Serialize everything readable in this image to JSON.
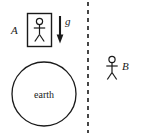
{
  "figure": {
    "type": "physics-diagram",
    "background_color": "#ffffff",
    "ink_color": "#1a1a1a"
  },
  "left_scene": {
    "observer_label": "A",
    "acceleration_label": "g",
    "planet_label": "earth",
    "box": {
      "x": 27,
      "y": 13,
      "width": 25,
      "height": 34
    },
    "planet_circle": {
      "cx": 44,
      "cy": 94,
      "r": 32
    },
    "arrow": {
      "x": 60,
      "y_start": 16,
      "y_end": 43,
      "direction": "down"
    }
  },
  "divider": {
    "name": "dashed-vertical-line",
    "x": 88,
    "y_start": 2,
    "y_end": 133,
    "dash": "4 4"
  },
  "right_scene": {
    "observer_label": "B",
    "figure_position": {
      "x": 112,
      "y": 56
    }
  },
  "stick_figures": [
    {
      "id": "figure-a",
      "label": "A",
      "inside_box": true
    },
    {
      "id": "figure-b",
      "label": "B",
      "inside_box": false
    }
  ]
}
